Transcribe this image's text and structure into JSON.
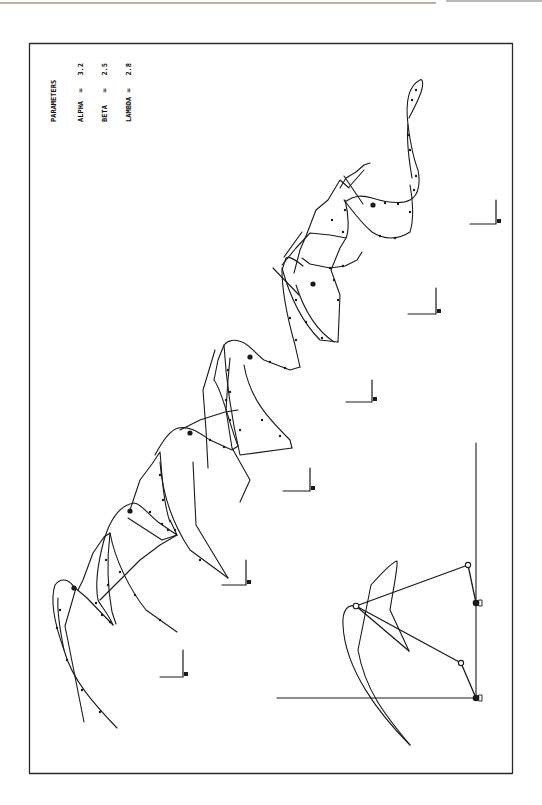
{
  "figure": {
    "parameters": {
      "title": "PARAMETERS",
      "rows": [
        {
          "name": "ALPHA",
          "eq": "=",
          "value": "3.2"
        },
        {
          "name": "BETA",
          "eq": "=",
          "value": "2.5"
        },
        {
          "name": "LAMBDA",
          "eq": "=",
          "value": "2.8"
        }
      ]
    },
    "colors": {
      "ink": "#1a1a1a",
      "frame": "#2a2a2a",
      "top_rule": "#c9a9a4",
      "background": "#ffffff"
    },
    "frame": {
      "x": 29,
      "y": 43,
      "width": 483,
      "height": 730
    },
    "axis_markers": [
      {
        "x": 183,
        "y": 677
      },
      {
        "x": 246,
        "y": 585
      },
      {
        "x": 310,
        "y": 491
      },
      {
        "x": 372,
        "y": 402
      },
      {
        "x": 436,
        "y": 314
      },
      {
        "x": 496,
        "y": 224
      }
    ],
    "linkage": {
      "ground_axis_vertical": {
        "x": 476,
        "y1": 443,
        "y2": 698
      },
      "ground_axis_horizontal": {
        "y": 698,
        "x1": 277,
        "x2": 476
      },
      "ground_pivots": [
        {
          "x": 476,
          "y": 603
        },
        {
          "x": 476,
          "y": 698
        }
      ],
      "moving_joints": [
        {
          "x": 468,
          "y": 565
        },
        {
          "x": 461,
          "y": 663
        }
      ],
      "coupler_point": {
        "x": 356,
        "y": 606
      },
      "coupler_tip": {
        "x": 409,
        "y": 651
      }
    }
  }
}
